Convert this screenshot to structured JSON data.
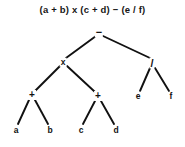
{
  "canvas": {
    "width": 185,
    "height": 147,
    "background": "#ffffff"
  },
  "title": "(a + b) x (c + d) − (e / f)",
  "chart_data": {
    "type": "diagram",
    "diagram_kind": "binary-expression-tree",
    "title": "(a + b) x (c + d) − (e / f)",
    "edge_color": "#111111",
    "node_color": "#111111",
    "background": "#ffffff",
    "nodes": [
      {
        "id": "n0",
        "label": "−",
        "kind": "operator",
        "role": "root",
        "depth": 0,
        "x": 99,
        "y": 32
      },
      {
        "id": "n1",
        "label": "x",
        "kind": "operator",
        "role": "internal",
        "depth": 1,
        "x": 63,
        "y": 62
      },
      {
        "id": "n2",
        "label": "/",
        "kind": "operator",
        "role": "internal",
        "depth": 1,
        "x": 152,
        "y": 63
      },
      {
        "id": "n3",
        "label": "+",
        "kind": "operator",
        "role": "internal",
        "depth": 2,
        "x": 32,
        "y": 95
      },
      {
        "id": "n4",
        "label": "+",
        "kind": "operator",
        "role": "internal",
        "depth": 2,
        "x": 98,
        "y": 96
      },
      {
        "id": "n5",
        "label": "e",
        "kind": "operand",
        "role": "leaf",
        "depth": 2,
        "x": 138,
        "y": 96
      },
      {
        "id": "n6",
        "label": "f",
        "kind": "operand",
        "role": "leaf",
        "depth": 2,
        "x": 171,
        "y": 96
      },
      {
        "id": "n7",
        "label": "a",
        "kind": "operand",
        "role": "leaf",
        "depth": 3,
        "x": 16,
        "y": 130
      },
      {
        "id": "n8",
        "label": "b",
        "kind": "operand",
        "role": "leaf",
        "depth": 3,
        "x": 50,
        "y": 130
      },
      {
        "id": "n9",
        "label": "c",
        "kind": "operand",
        "role": "leaf",
        "depth": 3,
        "x": 81,
        "y": 130
      },
      {
        "id": "n10",
        "label": "d",
        "kind": "operand",
        "role": "leaf",
        "depth": 3,
        "x": 116,
        "y": 130
      }
    ],
    "edges": [
      {
        "from": "n0",
        "to": "n1",
        "x1": 96,
        "y1": 36,
        "x2": 66,
        "y2": 58
      },
      {
        "from": "n0",
        "to": "n2",
        "x1": 103,
        "y1": 36,
        "x2": 150,
        "y2": 58
      },
      {
        "from": "n1",
        "to": "n3",
        "x1": 60,
        "y1": 66,
        "x2": 35,
        "y2": 91
      },
      {
        "from": "n1",
        "to": "n4",
        "x1": 67,
        "y1": 66,
        "x2": 95,
        "y2": 92
      },
      {
        "from": "n2",
        "to": "n5",
        "x1": 150,
        "y1": 68,
        "x2": 140,
        "y2": 91
      },
      {
        "from": "n2",
        "to": "n6",
        "x1": 155,
        "y1": 68,
        "x2": 169,
        "y2": 91
      },
      {
        "from": "n3",
        "to": "n7",
        "x1": 29,
        "y1": 100,
        "x2": 18,
        "y2": 124
      },
      {
        "from": "n3",
        "to": "n8",
        "x1": 35,
        "y1": 100,
        "x2": 48,
        "y2": 124
      },
      {
        "from": "n4",
        "to": "n9",
        "x1": 95,
        "y1": 101,
        "x2": 83,
        "y2": 124
      },
      {
        "from": "n4",
        "to": "n10",
        "x1": 101,
        "y1": 101,
        "x2": 114,
        "y2": 124
      }
    ]
  }
}
